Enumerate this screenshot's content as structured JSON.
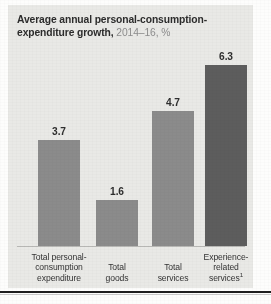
{
  "card": {
    "background_color": "#e9e9e6"
  },
  "title": {
    "main": "Average annual personal-consumption-expenditure growth,",
    "sub": "2014–16, %"
  },
  "chart_data": {
    "type": "bar",
    "title": "Average annual personal-consumption-expenditure growth, 2014–16, %",
    "xlabel": "",
    "ylabel": "",
    "ylim": [
      0,
      6.9
    ],
    "grid": false,
    "legend": "none",
    "categories": [
      "Total personal-consumption expenditure",
      "Total goods",
      "Total services",
      "Experience-related services¹"
    ],
    "category_lines": [
      [
        "Total personal-",
        "consumption",
        "expenditure"
      ],
      [
        "Total",
        "goods"
      ],
      [
        "Total",
        "services"
      ],
      [
        "Experience-",
        "related",
        "services"
      ]
    ],
    "values": [
      3.7,
      1.6,
      4.7,
      6.3
    ],
    "value_labels": [
      "3.7",
      "1.6",
      "4.7",
      "6.3"
    ],
    "bar_colors": [
      "#8b8b8b",
      "#8b8b8b",
      "#8b8b8b",
      "#5d5d5d"
    ],
    "highlight_index": 3,
    "footnote_marker": "1"
  },
  "colors": {
    "bar_default": "#8b8b8b",
    "bar_accent": "#5d5d5d",
    "title_main": "#2c2c2c",
    "title_sub": "#8c8c8c",
    "axis": "#b9b9b6"
  }
}
